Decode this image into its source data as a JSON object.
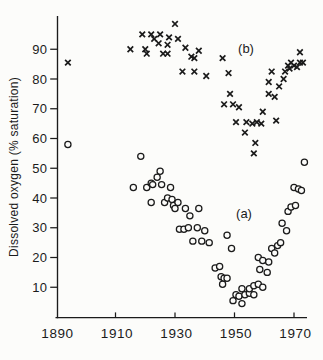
{
  "figure": {
    "background": "#fcfcfa",
    "ink": "#1b1b1b"
  },
  "chart_data": {
    "type": "scatter",
    "title": "",
    "xlabel": "",
    "ylabel": "Dissolved oxygen (% saturation)",
    "xlim": [
      1890,
      1975
    ],
    "ylim": [
      0,
      101
    ],
    "x_ticks": [
      1890,
      1910,
      1930,
      1950,
      1970
    ],
    "y_ticks": [
      10,
      20,
      30,
      40,
      50,
      60,
      70,
      80,
      90
    ],
    "grid": false,
    "legend_position": "inline-annotations",
    "annotations": [
      {
        "text": "(b)",
        "series": "b",
        "year": 1954,
        "value": 90.5
      },
      {
        "text": "(a)",
        "series": "a",
        "year": 1953,
        "value": 35
      }
    ],
    "series": [
      {
        "id": "b",
        "name": "(b)",
        "marker": "cross",
        "points": [
          [
            1894,
            85.5
          ],
          [
            1915,
            90
          ],
          [
            1919,
            95
          ],
          [
            1920,
            90
          ],
          [
            1920.5,
            88.5
          ],
          [
            1922,
            95
          ],
          [
            1923,
            93.5
          ],
          [
            1924.5,
            92
          ],
          [
            1925,
            95
          ],
          [
            1926,
            88.5
          ],
          [
            1927.5,
            88.5
          ],
          [
            1927.5,
            91.5
          ],
          [
            1928,
            94
          ],
          [
            1930,
            98.5
          ],
          [
            1931,
            93.5
          ],
          [
            1933.5,
            90.5
          ],
          [
            1935.5,
            87.5
          ],
          [
            1936.5,
            87
          ],
          [
            1938,
            89.5
          ],
          [
            1946,
            87
          ],
          [
            1932.5,
            82.5
          ],
          [
            1936.5,
            82.5
          ],
          [
            1940.5,
            81
          ],
          [
            1948,
            82
          ],
          [
            1946.5,
            71.5
          ],
          [
            1948.5,
            75
          ],
          [
            1949.5,
            71.5
          ],
          [
            1951.5,
            70.5
          ],
          [
            1950.5,
            65.5
          ],
          [
            1954,
            65.5
          ],
          [
            1956,
            65
          ],
          [
            1957.5,
            65.5
          ],
          [
            1959,
            65
          ],
          [
            1953.5,
            62
          ],
          [
            1956.5,
            55
          ],
          [
            1957,
            58.5
          ],
          [
            1959.5,
            69
          ],
          [
            1961.5,
            75
          ],
          [
            1961.5,
            79
          ],
          [
            1962.5,
            82.5
          ],
          [
            1963.5,
            74
          ],
          [
            1964,
            66
          ],
          [
            1965,
            77.5
          ],
          [
            1966.5,
            80
          ],
          [
            1967,
            82.5
          ],
          [
            1968,
            84.5
          ],
          [
            1968.5,
            83.5
          ],
          [
            1969,
            85.5
          ],
          [
            1970,
            84.5
          ],
          [
            1971,
            84
          ],
          [
            1972,
            85.5
          ],
          [
            1973,
            85.5
          ],
          [
            1972,
            89
          ]
        ]
      },
      {
        "id": "a",
        "name": "(a)",
        "marker": "circle",
        "points": [
          [
            1894,
            58
          ],
          [
            1918.5,
            54
          ],
          [
            1916,
            43.5
          ],
          [
            1920.5,
            43.5
          ],
          [
            1922,
            45
          ],
          [
            1922.5,
            44.5
          ],
          [
            1924,
            47
          ],
          [
            1925,
            49
          ],
          [
            1925.5,
            44.5
          ],
          [
            1928.5,
            43.5
          ],
          [
            1922,
            38.5
          ],
          [
            1926.5,
            38.5
          ],
          [
            1927.5,
            40
          ],
          [
            1929,
            39.5
          ],
          [
            1929.5,
            37.5
          ],
          [
            1931,
            38.5
          ],
          [
            1930,
            36.5
          ],
          [
            1933.5,
            36.5
          ],
          [
            1935,
            34
          ],
          [
            1938,
            36.5
          ],
          [
            1931.5,
            29.5
          ],
          [
            1933,
            29.5
          ],
          [
            1934.5,
            30
          ],
          [
            1937.5,
            30
          ],
          [
            1940,
            29
          ],
          [
            1936,
            25.5
          ],
          [
            1939,
            25.5
          ],
          [
            1941.5,
            25
          ],
          [
            1947.5,
            27.5
          ],
          [
            1949,
            23
          ],
          [
            1943.5,
            16.5
          ],
          [
            1945,
            17
          ],
          [
            1945.5,
            13.5
          ],
          [
            1946.5,
            13
          ],
          [
            1947.5,
            13
          ],
          [
            1946,
            11
          ],
          [
            1949.5,
            5.5
          ],
          [
            1950.5,
            7.5
          ],
          [
            1951.5,
            7
          ],
          [
            1952.5,
            4.5
          ],
          [
            1953.5,
            7.5
          ],
          [
            1955,
            8
          ],
          [
            1956.5,
            7.5
          ],
          [
            1952.5,
            9.5
          ],
          [
            1955,
            9.5
          ],
          [
            1956.5,
            10.5
          ],
          [
            1958,
            11
          ],
          [
            1959.5,
            10
          ],
          [
            1958,
            20
          ],
          [
            1958.5,
            16
          ],
          [
            1959.5,
            19
          ],
          [
            1961,
            15
          ],
          [
            1961.5,
            18.5
          ],
          [
            1962.5,
            23
          ],
          [
            1963.5,
            21.5
          ],
          [
            1964.5,
            24
          ],
          [
            1965.5,
            25
          ],
          [
            1966,
            31.5
          ],
          [
            1967.5,
            29
          ],
          [
            1968,
            35.5
          ],
          [
            1969,
            37
          ],
          [
            1970.5,
            37.5
          ],
          [
            1970,
            43.5
          ],
          [
            1971.5,
            43
          ],
          [
            1972.5,
            42.5
          ],
          [
            1973.5,
            52
          ]
        ]
      }
    ]
  }
}
